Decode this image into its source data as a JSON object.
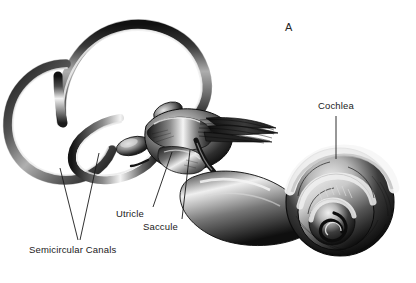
{
  "figure": {
    "panel_label": "A",
    "style": "engraving",
    "background_color": "#ffffff",
    "ink_color": "#1a1a1a",
    "width": 416,
    "height": 283
  },
  "labels": [
    {
      "id": "cochlea",
      "text": "Cochlea",
      "x": 318,
      "y": 100,
      "leader": {
        "x1": 336,
        "y1": 116,
        "x2": 336,
        "y2": 159
      }
    },
    {
      "id": "utricle",
      "text": "Utricle",
      "x": 116,
      "y": 208,
      "leader": {
        "x1": 153,
        "y1": 207,
        "x2": 172,
        "y2": 152
      }
    },
    {
      "id": "saccule",
      "text": "Saccule",
      "x": 143,
      "y": 221,
      "leader": {
        "x1": 182,
        "y1": 219,
        "x2": 190,
        "y2": 150
      }
    },
    {
      "id": "semicircular-canals",
      "text": "Semicircular Canals",
      "x": 29,
      "y": 244,
      "leaders": [
        {
          "x1": 78,
          "y1": 240,
          "x2": 60,
          "y2": 168
        },
        {
          "x1": 80,
          "y1": 240,
          "x2": 99,
          "y2": 153
        }
      ]
    }
  ],
  "structures": [
    {
      "name": "superior-semicircular-canal"
    },
    {
      "name": "posterior-semicircular-canal"
    },
    {
      "name": "lateral-semicircular-canal"
    },
    {
      "name": "vestibule"
    },
    {
      "name": "vestibulocochlear-nerve"
    },
    {
      "name": "cochlear-spiral"
    }
  ]
}
